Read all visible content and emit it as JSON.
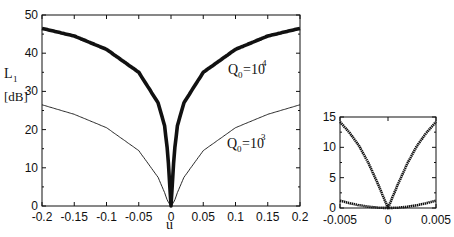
{
  "chart_data": [
    {
      "type": "line",
      "title": "",
      "xlabel": "u",
      "ylabel": "L1 [dB]",
      "xlim": [
        -0.2,
        0.2
      ],
      "ylim": [
        0,
        50
      ],
      "xticks": [
        "-0.2",
        "-0.15",
        "-0.1",
        "-0.05",
        "0",
        "0.05",
        "0.1",
        "0.15",
        "0.2"
      ],
      "yticks": [
        "0",
        "10",
        "20",
        "30",
        "40",
        "50"
      ],
      "grid": false,
      "annotations": [
        "Q0=10^4",
        "Q0=10^3"
      ],
      "x": [
        -0.2,
        -0.15,
        -0.1,
        -0.05,
        -0.02,
        -0.01,
        -0.005,
        0,
        0.005,
        0.01,
        0.02,
        0.05,
        0.1,
        0.15,
        0.2
      ],
      "series": [
        {
          "name": "Q0=10^4",
          "values": [
            46.5,
            44.5,
            41,
            35,
            27,
            21,
            14,
            0,
            14,
            21,
            27,
            35,
            41,
            44.5,
            46.5
          ],
          "style": "thick"
        },
        {
          "name": "Q0=10^3",
          "values": [
            26.5,
            24,
            20.5,
            14.5,
            7.5,
            3.5,
            1.2,
            0,
            1.2,
            3.5,
            7.5,
            14.5,
            20.5,
            24,
            26.5
          ],
          "style": "thin"
        }
      ]
    },
    {
      "type": "line",
      "title": "",
      "xlabel": "",
      "ylabel": "",
      "xlim": [
        -0.005,
        0.005
      ],
      "ylim": [
        0,
        15
      ],
      "xticks": [
        "-0.005",
        "0",
        "0.005"
      ],
      "yticks": [
        "0",
        "5",
        "10",
        "15"
      ],
      "grid": false,
      "x": [
        -0.005,
        -0.004,
        -0.003,
        -0.002,
        -0.001,
        0,
        0.001,
        0.002,
        0.003,
        0.004,
        0.005
      ],
      "series": [
        {
          "name": "Q0=10^4",
          "values": [
            14.2,
            12.4,
            10.2,
            7.3,
            3.8,
            0,
            3.8,
            7.3,
            10.2,
            12.4,
            14.2
          ],
          "style": "dotted-thick"
        },
        {
          "name": "Q0=10^3",
          "values": [
            1.2,
            0.8,
            0.45,
            0.2,
            0.05,
            0,
            0.05,
            0.2,
            0.45,
            0.8,
            1.2
          ],
          "style": "dotted-thick"
        }
      ]
    }
  ],
  "labels": {
    "ylabel_main": "L",
    "ylabel_sub": "1",
    "ylabel_unit": "[dB]",
    "xlabel": "u",
    "q4_Q": "Q",
    "q4_sub": "0",
    "q4_eq": "=10",
    "q4_exp": "4",
    "q3_Q": "Q",
    "q3_sub": "0",
    "q3_eq": "=10",
    "q3_exp": "3"
  }
}
